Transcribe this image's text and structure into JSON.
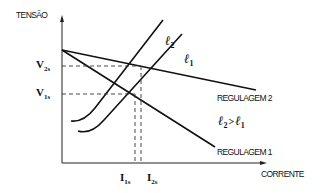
{
  "diagram": {
    "y_axis_label": "TENSÃO",
    "x_axis_label": "CORRENTE",
    "lines": {
      "regulation_2": {
        "label": "REGULAGEM 2"
      },
      "regulation_1": {
        "label": "REGULAGEM 1"
      }
    },
    "curves": {
      "l2": {
        "symbol": "ℓ",
        "sub": "2"
      },
      "l1": {
        "symbol": "ℓ",
        "sub": "1"
      }
    },
    "relation": {
      "left": "ℓ",
      "left_sub": "2",
      "op": ">",
      "right": "ℓ",
      "right_sub": "1"
    },
    "y_ticks": {
      "v2s": {
        "main": "V",
        "sub": "2s"
      },
      "v1s": {
        "main": "V",
        "sub": "1s"
      }
    },
    "x_ticks": {
      "i1s": {
        "main": "I",
        "sub": "1s"
      },
      "i2s": {
        "main": "I",
        "sub": "2s"
      }
    }
  }
}
